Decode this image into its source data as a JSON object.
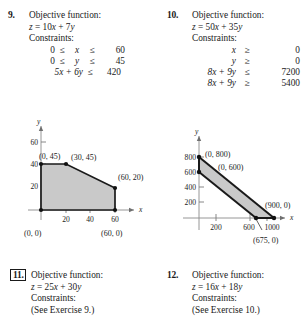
{
  "page": {
    "background": "#ffffff",
    "shade_color": "#c9c9c9",
    "ink": "#1a1a1a"
  },
  "exercises": [
    {
      "number": "9.",
      "boxed": false,
      "objective_label": "Objective function:",
      "objective": "z = 10x + 7y",
      "constraints_label": "Constraints:",
      "constraints": [
        {
          "a": "0",
          "op1": "≤",
          "var": "x",
          "op2": "≤",
          "b": "60"
        },
        {
          "a": "0",
          "op1": "≤",
          "var": "y",
          "op2": "≤",
          "b": "45"
        },
        {
          "expr": "5x + 6y",
          "op": "≤",
          "b": "420"
        }
      ]
    },
    {
      "number": "10.",
      "boxed": false,
      "objective_label": "Objective function:",
      "objective": "z = 50x + 35y",
      "constraints_label": "Constraints:",
      "constraints": [
        {
          "expr": "x",
          "op": "≥",
          "b": "0"
        },
        {
          "expr": "y",
          "op": "≥",
          "b": "0"
        },
        {
          "expr": "8x + 9y",
          "op": "≤",
          "b": "7200"
        },
        {
          "expr": "8x + 9y",
          "op": "≥",
          "b": "5400"
        }
      ]
    },
    {
      "number": "11.",
      "boxed": true,
      "objective_label": "Objective function:",
      "objective": "z = 25x + 30y",
      "constraints_label": "Constraints:",
      "see_ref": "(See Exercise 9.)"
    },
    {
      "number": "12.",
      "boxed": false,
      "objective_label": "Objective function:",
      "objective": "z = 16x + 18y",
      "constraints_label": "Constraints:",
      "see_ref": "(See Exercise 10.)"
    }
  ],
  "chart_data": [
    {
      "id": "graph-9",
      "type": "area",
      "title": "",
      "xlabel": "x",
      "ylabel": "y",
      "xlim": [
        -8,
        78
      ],
      "ylim": [
        -9,
        72
      ],
      "xticks": [
        20,
        40,
        60
      ],
      "yticks": [
        20,
        40,
        60
      ],
      "grid": false,
      "shade_color": "#c9c9c9",
      "region_label": "Feasible region",
      "vertices": [
        {
          "x": 0,
          "y": 0,
          "label": "(0, 0)",
          "label_pos": "below-left"
        },
        {
          "x": 60,
          "y": 0,
          "label": "(60, 0)",
          "label_pos": "below-right"
        },
        {
          "x": 60,
          "y": 20,
          "label": "(60, 20)",
          "label_pos": "right"
        },
        {
          "x": 30,
          "y": 45,
          "label": "(30, 45)",
          "label_pos": "upper-right"
        },
        {
          "x": 0,
          "y": 45,
          "label": "(0, 45)",
          "label_pos": "upper-left"
        }
      ]
    },
    {
      "id": "graph-10",
      "type": "area",
      "title": "",
      "xlabel": "x",
      "ylabel": "y",
      "xlim": [
        -130,
        1230
      ],
      "ylim": [
        -150,
        1000
      ],
      "xticks": [
        200,
        600,
        1000
      ],
      "yticks": [
        200,
        400,
        600,
        800
      ],
      "grid": false,
      "shade_color": "#c9c9c9",
      "region_label": "Feasible region (band)",
      "vertices": [
        {
          "x": 0,
          "y": 800,
          "label": "(0, 800)",
          "label_pos": "right"
        },
        {
          "x": 0,
          "y": 600,
          "label": "(0, 600)",
          "label_pos": "right"
        },
        {
          "x": 675,
          "y": 0,
          "label": "(675, 0)",
          "label_pos": "below-leader"
        },
        {
          "x": 900,
          "y": 0,
          "label": "(900, 0)",
          "label_pos": "upper-right"
        }
      ]
    }
  ]
}
